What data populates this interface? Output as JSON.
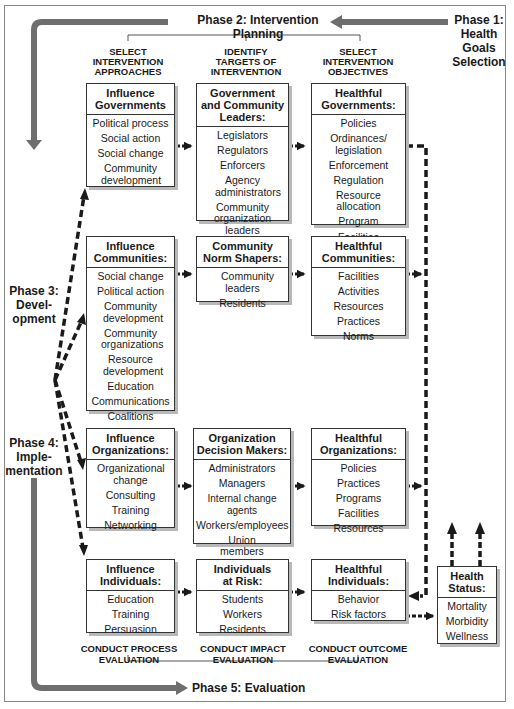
{
  "phases": {
    "phase1": "Phase 1:\nHealth\nGoals\nSelection",
    "phase1_lines": [
      "Phase 1:",
      "Health",
      "Goals",
      "Selection"
    ],
    "phase2": "Phase 2: Intervention Planning",
    "phase3_lines": [
      "Phase 3:",
      "Devel-",
      "opment"
    ],
    "phase4_lines": [
      "Phase 4:",
      "Imple-",
      "mentation"
    ],
    "phase5": "Phase 5: Evaluation"
  },
  "column_headers": [
    [
      "SELECT",
      "INTERVENTION",
      "APPROACHES"
    ],
    [
      "IDENTIFY",
      "TARGETS OF",
      "INTERVENTION"
    ],
    [
      "SELECT",
      "INTERVENTION",
      "OBJECTIVES"
    ]
  ],
  "boxes": {
    "influence_governments": {
      "title": [
        "Influence",
        "Governments"
      ],
      "items": [
        "Political process",
        "Social action",
        "Social change",
        "Community development"
      ]
    },
    "gov_community_leaders": {
      "title": [
        "Government",
        "and Community",
        "Leaders:"
      ],
      "items": [
        "Legislators",
        "Regulators",
        "Enforcers",
        "Agency administrators",
        "Community organization leaders"
      ]
    },
    "healthful_governments": {
      "title": [
        "Healthful",
        "Governments:"
      ],
      "items": [
        "Policies",
        "Ordinances/ legislation",
        "Enforcement",
        "Regulation",
        "Resource allocation",
        "Program",
        "Facilities"
      ]
    },
    "influence_communities": {
      "title": [
        "Influence",
        "Communities:"
      ],
      "items": [
        "Social change",
        "Political action",
        "Community development",
        "Community organizations",
        "Resource development",
        "Education",
        "Communications",
        "Coalitions"
      ]
    },
    "community_norm_shapers": {
      "title": [
        "Community",
        "Norm Shapers:"
      ],
      "items": [
        "Community leaders",
        "Residents"
      ]
    },
    "healthful_communities": {
      "title": [
        "Healthful",
        "Communities:"
      ],
      "items": [
        "Facilities",
        "Activities",
        "Resources",
        "Practices",
        "Norms"
      ]
    },
    "influence_organizations": {
      "title": [
        "Influence",
        "Organizations:"
      ],
      "items": [
        "Organizational change",
        "Consulting",
        "Training",
        "Networking"
      ]
    },
    "organization_decision_makers": {
      "title": [
        "Organization",
        "Decision Makers:"
      ],
      "items": [
        "Administrators",
        "Managers",
        "Internal change agents",
        "Workers/employees",
        "Union members and leaders"
      ]
    },
    "healthful_organizations": {
      "title": [
        "Healthful",
        "Organizations:"
      ],
      "items": [
        "Policies",
        "Practices",
        "Programs",
        "Facilities",
        "Resources"
      ]
    },
    "influence_individuals": {
      "title": [
        "Influence",
        "Individuals:"
      ],
      "items": [
        "Education",
        "Training",
        "Persuasion"
      ]
    },
    "individuals_at_risk": {
      "title": [
        "Individuals",
        "at Risk:"
      ],
      "items": [
        "Students",
        "Workers",
        "Residents"
      ]
    },
    "healthful_individuals": {
      "title": [
        "Healthful",
        "Individuals:"
      ],
      "items": [
        "Behavior",
        "Risk factors"
      ]
    },
    "health_status": {
      "title": [
        "Health",
        "Status:"
      ],
      "items": [
        "Mortality",
        "Morbidity",
        "Wellness"
      ]
    }
  },
  "footers": [
    [
      "CONDUCT PROCESS",
      "EVALUATION"
    ],
    [
      "CONDUCT IMPACT",
      "EVALUATION"
    ],
    [
      "CONDUCT OUTCOME",
      "EVALUATION"
    ]
  ],
  "colors": {
    "phase_arrow": "#6e6e6e",
    "dashed_arrow": "#1a1a1a",
    "box_border": "#333333",
    "box_shadow": "#b8b8b8"
  }
}
